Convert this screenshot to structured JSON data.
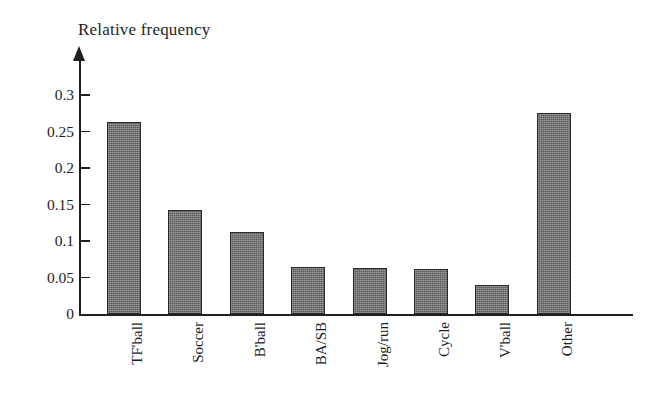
{
  "chart": {
    "axis_title": "Relative frequency",
    "y_axis_arrow": "up-arrow"
  },
  "chart_data": {
    "type": "bar",
    "title": "",
    "subtitle": "",
    "xlabel": "",
    "ylabel": "Relative frequency",
    "categories": [
      "TF'ball",
      "Soccer",
      "B'ball",
      "BA/SB",
      "Jog/run",
      "Cycle",
      "V'ball",
      "Other"
    ],
    "values": [
      0.263,
      0.142,
      0.112,
      0.064,
      0.063,
      0.062,
      0.04,
      0.275
    ],
    "ylim": [
      0,
      0.31
    ],
    "yticks": [
      0,
      0.05,
      0.1,
      0.15,
      0.2,
      0.25,
      0.3
    ],
    "ytick_labels": [
      "0",
      "0.05",
      "0.1",
      "0.15",
      "0.2",
      "0.25",
      "0.3"
    ],
    "grid": false,
    "legend": null,
    "bar_color": "#717171",
    "bar_edge_color": "#2a2a2a",
    "axis_color": "#1f1f1f",
    "background_color": "#ffffff"
  }
}
